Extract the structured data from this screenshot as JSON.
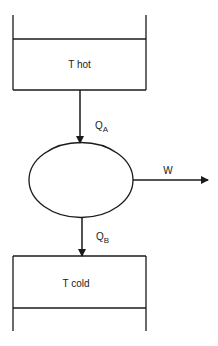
{
  "diagram": {
    "type": "heat-engine-schematic",
    "hot_reservoir": {
      "label": "T hot"
    },
    "cold_reservoir": {
      "label": "T cold"
    },
    "engine": {
      "shape": "ellipse"
    },
    "flows": {
      "heat_in": {
        "symbol": "Q",
        "subscript": "A"
      },
      "heat_out": {
        "symbol": "Q",
        "subscript": "B"
      },
      "work": {
        "label": "W"
      }
    },
    "colors": {
      "stroke": "#1a1a1a",
      "background": "#ffffff"
    }
  }
}
